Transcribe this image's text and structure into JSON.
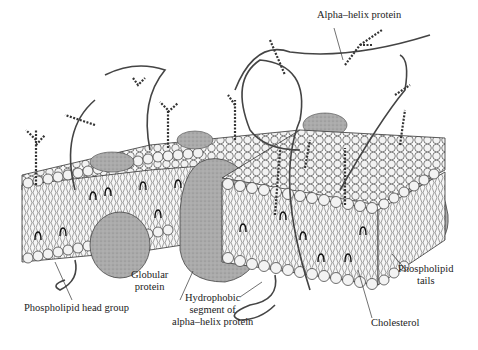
{
  "diagram": {
    "labels": {
      "alpha_helix_protein": "Alpha–helix protein",
      "phospholipid_head_group": "Phospholipid head group",
      "globular_protein_line1": "Globular",
      "globular_protein_line2": "protein",
      "hydrophobic_line1": "Hydrophobic",
      "hydrophobic_line2": "segment of",
      "hydrophobic_line3": "alpha–helix protein",
      "phospholipid_tails_line1": "Phospholipid",
      "phospholipid_tails_line2": "tails",
      "cholesterol": "Cholesterol"
    },
    "colors": {
      "protein_fill": "#a9a9a9",
      "head_fill": "#f4f4f4",
      "outline": "#222222"
    }
  }
}
